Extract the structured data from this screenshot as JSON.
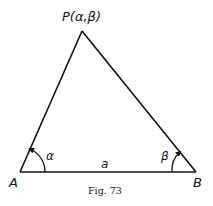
{
  "figure": {
    "caption": "Fig. 73",
    "vertices": {
      "P": {
        "label": "P(α,β)",
        "x": 82,
        "y": 31
      },
      "A": {
        "label": "A",
        "x": 20,
        "y": 172
      },
      "B": {
        "label": "B",
        "x": 196,
        "y": 172
      }
    },
    "angles": {
      "at_A": {
        "label": "α"
      },
      "at_B": {
        "label": "β"
      }
    },
    "sides": {
      "AB": {
        "label": "a"
      }
    },
    "stroke_color": "#111111",
    "background": "#ffffff"
  }
}
